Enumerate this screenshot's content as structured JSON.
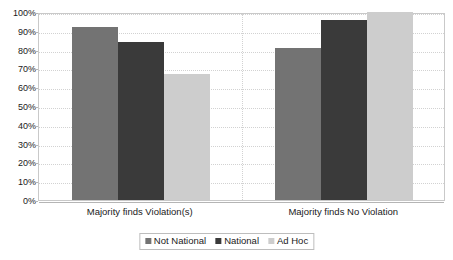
{
  "chart_data": {
    "type": "bar",
    "title": "",
    "subtitle": "",
    "xlabel": "",
    "ylabel": "",
    "ylim": [
      0,
      100
    ],
    "grid": true,
    "legend_position": "bottom-center",
    "categories": [
      "Majority finds Violation(s)",
      "Majority finds No Violation"
    ],
    "ytick_labels": [
      "100%",
      "90%",
      "80%",
      "70%",
      "60%",
      "50%",
      "40%",
      "30%",
      "20%",
      "10%",
      "0%"
    ],
    "ytick_values": [
      100,
      90,
      80,
      70,
      60,
      50,
      40,
      30,
      20,
      10,
      0
    ],
    "series": [
      {
        "name": "Not National",
        "color": "#737373",
        "values": [
          92,
          81
        ]
      },
      {
        "name": "National",
        "color": "#3a3a3a",
        "values": [
          84,
          96
        ]
      },
      {
        "name": "Ad Hoc",
        "color": "#cdcdcd",
        "values": [
          67,
          100
        ]
      }
    ]
  },
  "legend": {
    "items": [
      {
        "label": "Not National"
      },
      {
        "label": "National"
      },
      {
        "label": "Ad Hoc"
      }
    ]
  }
}
